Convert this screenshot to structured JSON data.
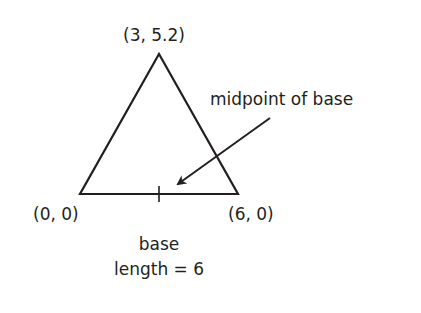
{
  "diagram": {
    "type": "labeled triangle",
    "vertices": [
      {
        "label": "(0, 0)",
        "x": 0,
        "y": 0
      },
      {
        "label": "(6, 0)",
        "x": 6,
        "y": 0
      },
      {
        "label": "(3, 5.2)",
        "x": 3,
        "y": 5.2
      }
    ],
    "annotation": "midpoint of base",
    "base_label_line1": "base",
    "base_label_line2": "length = 6",
    "stroke_color": "#231f20"
  }
}
